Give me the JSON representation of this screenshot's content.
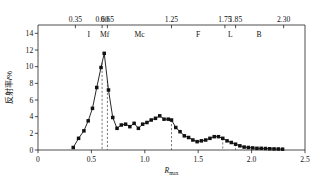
{
  "chart_data": {
    "type": "line",
    "title": "",
    "xlabel": "Rmax",
    "xlabel_base": "R",
    "xlabel_sub": "max",
    "ylabel": "反射率/%",
    "xlim": [
      0,
      2.5
    ],
    "ylim": [
      0,
      15
    ],
    "xticks": [
      0,
      0.5,
      1.0,
      1.5,
      2.0,
      2.5
    ],
    "xticklabels": [
      "0",
      "0.5",
      "1.0",
      "1.5",
      "2.0",
      "2.5"
    ],
    "yticks": [
      0,
      2,
      4,
      6,
      8,
      10,
      12,
      14
    ],
    "yticklabels": [
      "0",
      "2",
      "4",
      "6",
      "8",
      "10",
      "12",
      "14"
    ],
    "grid": false,
    "legend": "none",
    "marker": "square",
    "series": [
      {
        "name": "反射率分布",
        "x": [
          0.33,
          0.38,
          0.43,
          0.47,
          0.51,
          0.55,
          0.59,
          0.62,
          0.66,
          0.7,
          0.74,
          0.78,
          0.82,
          0.86,
          0.9,
          0.94,
          0.98,
          1.02,
          1.06,
          1.1,
          1.14,
          1.18,
          1.22,
          1.25,
          1.29,
          1.33,
          1.37,
          1.41,
          1.45,
          1.49,
          1.53,
          1.57,
          1.61,
          1.65,
          1.69,
          1.73,
          1.77,
          1.81,
          1.85,
          1.89,
          1.93,
          1.97,
          2.01,
          2.05,
          2.09,
          2.13,
          2.17,
          2.21,
          2.25,
          2.29
        ],
        "y": [
          0.3,
          1.4,
          2.3,
          3.5,
          5.0,
          7.5,
          9.9,
          11.6,
          7.2,
          3.9,
          2.6,
          3.0,
          3.1,
          2.8,
          3.2,
          2.6,
          3.1,
          3.3,
          3.6,
          3.8,
          4.1,
          3.7,
          3.7,
          3.6,
          2.7,
          2.2,
          1.7,
          1.5,
          1.2,
          1.0,
          1.1,
          1.2,
          1.4,
          1.6,
          1.6,
          1.4,
          1.1,
          0.9,
          0.7,
          0.5,
          0.35,
          0.3,
          0.25,
          0.2,
          0.2,
          0.18,
          0.15,
          0.13,
          0.12,
          0.1
        ]
      }
    ],
    "top_axis": {
      "ticks": [
        0.35,
        0.6,
        0.65,
        1.25,
        1.75,
        1.85,
        2.3
      ],
      "labels": [
        "0.35",
        "0.60",
        "0.65",
        "1.25",
        "1.75",
        "1.85",
        "2.30"
      ]
    },
    "zones": [
      {
        "label": "I",
        "center": 0.475
      },
      {
        "label": "Mf",
        "center": 0.625
      },
      {
        "label": "Mc",
        "center": 0.95
      },
      {
        "label": "F",
        "center": 1.5
      },
      {
        "label": "L",
        "center": 1.8
      },
      {
        "label": "B",
        "center": 2.07
      }
    ],
    "reference_lines": [
      {
        "x": 0.6,
        "style": "dashed"
      },
      {
        "x": 0.65,
        "style": "dashed"
      },
      {
        "x": 1.25,
        "style": "dashed"
      },
      {
        "x": 1.73,
        "style": "dashed"
      },
      {
        "x": 1.85,
        "style": "dashed"
      }
    ],
    "colors": {
      "curve": "#111111",
      "marker": "#111111",
      "axis": "#222222",
      "dashed": "#444444",
      "background": "#ffffff"
    }
  }
}
